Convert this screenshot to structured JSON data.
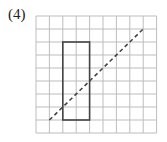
{
  "label": "(4)",
  "grid": {
    "cols": 9,
    "rows": 9,
    "x0": 36,
    "y0": 16,
    "cw": 13.4,
    "ch": 13.0,
    "color": "#bdbdbd"
  },
  "rectangle": {
    "col0": 2,
    "row0": 2,
    "col1": 4,
    "row1": 8,
    "color": "#444444"
  },
  "dashed_line": {
    "from": [
      1,
      8
    ],
    "to": [
      8,
      1
    ],
    "color": "#444444"
  }
}
